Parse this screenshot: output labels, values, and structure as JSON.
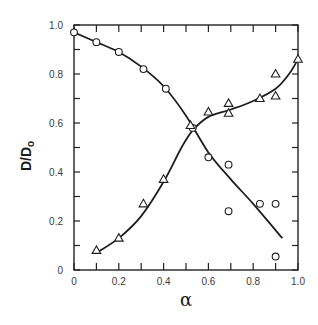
{
  "chart_data": {
    "type": "scatter",
    "title": "",
    "xlabel": "α",
    "ylabel": "D/D",
    "ylabel_subscript": "o",
    "xlim": [
      0,
      1.0
    ],
    "ylim": [
      0,
      1.0
    ],
    "grid": false,
    "legend": null,
    "x_ticks": [
      0,
      0.2,
      0.4,
      0.6,
      0.8,
      1.0
    ],
    "x_tick_labels": [
      "0",
      "0.2",
      "0.4",
      "0.6",
      "0.8",
      "1.0"
    ],
    "x_minor_ticks": [
      0.1,
      0.3,
      0.5,
      0.7,
      0.9
    ],
    "y_ticks": [
      0,
      0.2,
      0.4,
      0.6,
      0.8,
      1.0
    ],
    "y_tick_labels": [
      "0",
      "0.2",
      "0.4",
      "0.6",
      "0.8",
      "1.0"
    ],
    "y_minor_ticks": [
      0.1,
      0.3,
      0.5,
      0.7,
      0.9
    ],
    "series": [
      {
        "name": "circles",
        "marker": "circle",
        "points": [
          [
            0.0,
            0.97
          ],
          [
            0.1,
            0.93
          ],
          [
            0.2,
            0.89
          ],
          [
            0.31,
            0.82
          ],
          [
            0.41,
            0.74
          ],
          [
            0.53,
            0.58
          ],
          [
            0.6,
            0.46
          ],
          [
            0.69,
            0.43
          ],
          [
            0.69,
            0.24
          ],
          [
            0.83,
            0.27
          ],
          [
            0.9,
            0.27
          ],
          [
            0.9,
            0.055
          ]
        ],
        "fit_curve": [
          [
            0.0,
            0.97
          ],
          [
            0.1,
            0.93
          ],
          [
            0.2,
            0.89
          ],
          [
            0.3,
            0.83
          ],
          [
            0.4,
            0.75
          ],
          [
            0.5,
            0.63
          ],
          [
            0.6,
            0.48
          ],
          [
            0.7,
            0.37
          ],
          [
            0.8,
            0.27
          ],
          [
            0.93,
            0.13
          ]
        ]
      },
      {
        "name": "triangles",
        "marker": "triangle",
        "points": [
          [
            0.1,
            0.08
          ],
          [
            0.2,
            0.13
          ],
          [
            0.31,
            0.27
          ],
          [
            0.4,
            0.37
          ],
          [
            0.52,
            0.59
          ],
          [
            0.6,
            0.645
          ],
          [
            0.69,
            0.68
          ],
          [
            0.69,
            0.64
          ],
          [
            0.83,
            0.7
          ],
          [
            0.9,
            0.8
          ],
          [
            0.9,
            0.71
          ],
          [
            1.0,
            0.86
          ]
        ],
        "fit_curve": [
          [
            0.1,
            0.07
          ],
          [
            0.2,
            0.13
          ],
          [
            0.3,
            0.22
          ],
          [
            0.4,
            0.36
          ],
          [
            0.48,
            0.5
          ],
          [
            0.53,
            0.57
          ],
          [
            0.6,
            0.625
          ],
          [
            0.7,
            0.655
          ],
          [
            0.8,
            0.69
          ],
          [
            0.9,
            0.74
          ],
          [
            0.96,
            0.8
          ],
          [
            1.0,
            0.86
          ]
        ]
      }
    ]
  }
}
